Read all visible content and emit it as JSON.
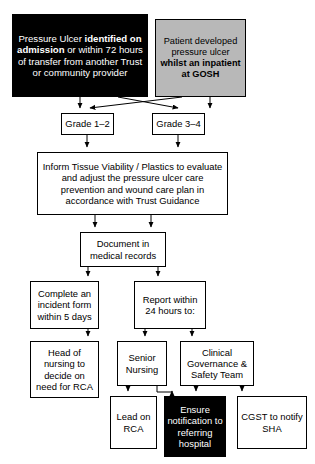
{
  "diagram": {
    "colors": {
      "black_box": "#000000",
      "black_box_text": "#ffffff",
      "gray_box": "#b8b8b8",
      "plain_box": "#ffffff",
      "border": "#000000",
      "background": "#ffffff"
    },
    "nodes": [
      {
        "id": "identified-on-admission",
        "name": "node-identified-on-admission",
        "style": "black",
        "x": 12,
        "y": 14,
        "w": 136,
        "h": 83,
        "font_size": 9.6,
        "segments": [
          {
            "text": "Pressure Ulcer ",
            "bold": false
          },
          {
            "text": "identified on admission",
            "bold": true
          },
          {
            "text": " or within 72 hours of transfer from another Trust or community provider",
            "bold": false
          }
        ],
        "text": "Pressure Ulcer identified on admission or within 72 hours of transfer from another Trust or community provider"
      },
      {
        "id": "developed-at-gosh",
        "name": "node-developed-at-gosh",
        "style": "gray",
        "x": 155,
        "y": 19,
        "w": 91,
        "h": 78,
        "font_size": 9.2,
        "segments": [
          {
            "text": "Patient developed pressure ulcer ",
            "bold": false
          },
          {
            "text": "whilst an inpatient at GOSH",
            "bold": true
          }
        ],
        "text": "Patient developed pressure ulcer whilst an inpatient at GOSH"
      },
      {
        "id": "grade-1-2",
        "name": "node-grade-1-2",
        "style": "plain",
        "x": 61,
        "y": 113,
        "w": 53,
        "h": 22,
        "font_size": 9.4,
        "text": "Grade 1–2"
      },
      {
        "id": "grade-3-4",
        "name": "node-grade-3-4",
        "style": "plain",
        "x": 152,
        "y": 113,
        "w": 53,
        "h": 22,
        "font_size": 9.4,
        "text": "Grade 3–4"
      },
      {
        "id": "inform-tissue-viability",
        "name": "node-inform-tissue-viability",
        "style": "plain",
        "x": 37,
        "y": 152,
        "w": 191,
        "h": 63,
        "font_size": 9.4,
        "text": "Inform Tissue Viability / Plastics to evaluate and adjust the pressure ulcer care prevention and wound care plan in accordance with Trust Guidance"
      },
      {
        "id": "document-in-medical-records",
        "name": "node-document-in-medical-records",
        "style": "plain",
        "x": 80,
        "y": 232,
        "w": 86,
        "h": 35,
        "font_size": 9.4,
        "text": "Document in medical records"
      },
      {
        "id": "complete-incident-form",
        "name": "node-complete-incident-form",
        "style": "plain",
        "x": 30,
        "y": 281,
        "w": 69,
        "h": 48,
        "font_size": 9.4,
        "text": "Complete an incident form within 5 days"
      },
      {
        "id": "report-within-24-hours",
        "name": "node-report-within-24-hours",
        "style": "plain",
        "x": 134,
        "y": 281,
        "w": 72,
        "h": 48,
        "font_size": 9.4,
        "text": "Report within 24 hours to:"
      },
      {
        "id": "head-of-nursing-rca",
        "name": "node-head-of-nursing-rca",
        "style": "plain",
        "x": 30,
        "y": 341,
        "w": 69,
        "h": 57,
        "font_size": 9.4,
        "text": "Head of nursing to decide on need for RCA"
      },
      {
        "id": "senior-nursing",
        "name": "node-senior-nursing",
        "style": "plain",
        "x": 117,
        "y": 341,
        "w": 50,
        "h": 45,
        "font_size": 9.4,
        "text": "Senior Nursing"
      },
      {
        "id": "clinical-governance-safety-team",
        "name": "node-clinical-governance-safety-team",
        "style": "plain",
        "x": 180,
        "y": 341,
        "w": 74,
        "h": 45,
        "font_size": 9.4,
        "text": "Clinical Governance & Safety Team"
      },
      {
        "id": "lead-on-rca",
        "name": "node-lead-on-rca",
        "style": "plain",
        "x": 110,
        "y": 396,
        "w": 47,
        "h": 53,
        "font_size": 9.4,
        "text": "Lead on RCA"
      },
      {
        "id": "ensure-notification",
        "name": "node-ensure-notification",
        "style": "black",
        "x": 164,
        "y": 396,
        "w": 62,
        "h": 61,
        "font_size": 9.4,
        "text": "Ensure notification to referring hospital"
      },
      {
        "id": "cgst-notify-sha",
        "name": "node-cgst-notify-sha",
        "style": "plain",
        "x": 237,
        "y": 396,
        "w": 70,
        "h": 53,
        "font_size": 9.4,
        "text": "CGST to notify SHA"
      }
    ],
    "edges": [
      {
        "id": "e1",
        "name": "edge-identified-to-grade-1-2",
        "from": "identified-on-admission",
        "to": "grade-1-2",
        "path": "M80,97 L80,108"
      },
      {
        "id": "e2",
        "name": "edge-identified-to-grade-3-4",
        "from": "identified-on-admission",
        "to": "grade-3-4",
        "path": "M118,97 L178,108"
      },
      {
        "id": "e3",
        "name": "edge-gosh-to-grade-1-2",
        "from": "developed-at-gosh",
        "to": "grade-1-2",
        "path": "M182,97 L90,108"
      },
      {
        "id": "e4",
        "name": "edge-gosh-to-grade-3-4",
        "from": "developed-at-gosh",
        "to": "grade-3-4",
        "path": "M210,97 L210,108"
      },
      {
        "id": "e5",
        "name": "edge-grade-1-2-to-inform",
        "from": "grade-1-2",
        "to": "inform-tissue-viability",
        "path": "M87,135 L87,147"
      },
      {
        "id": "e6",
        "name": "edge-grade-3-4-to-inform",
        "from": "grade-3-4",
        "to": "inform-tissue-viability",
        "path": "M178,135 L178,147"
      },
      {
        "id": "e7",
        "name": "edge-inform-to-document-left",
        "from": "inform-tissue-viability",
        "to": "document-in-medical-records",
        "path": "M95,215 L95,227"
      },
      {
        "id": "e8",
        "name": "edge-inform-to-document-right",
        "from": "inform-tissue-viability",
        "to": "document-in-medical-records",
        "path": "M151,215 L151,227"
      },
      {
        "id": "e9",
        "name": "edge-document-to-incident-form",
        "from": "document-in-medical-records",
        "to": "complete-incident-form",
        "path": "M88,267 L88,276"
      },
      {
        "id": "e10",
        "name": "edge-document-to-report",
        "from": "document-in-medical-records",
        "to": "report-within-24-hours",
        "path": "M158,267 L158,276"
      },
      {
        "id": "e11",
        "name": "edge-incident-to-head-of-nursing",
        "from": "complete-incident-form",
        "to": "head-of-nursing-rca",
        "path": "M88,329 L88,336"
      },
      {
        "id": "e12",
        "name": "edge-report-to-senior-nursing",
        "from": "report-within-24-hours",
        "to": "senior-nursing",
        "path": "M145,329 L145,336"
      },
      {
        "id": "e13",
        "name": "edge-report-to-clinical-governance",
        "from": "report-within-24-hours",
        "to": "clinical-governance-safety-team",
        "path": "M192,329 L192,336"
      },
      {
        "id": "e14",
        "name": "edge-senior-nursing-to-lead-rca",
        "from": "senior-nursing",
        "to": "lead-on-rca",
        "path": "M128,386 L128,391"
      },
      {
        "id": "e15",
        "name": "edge-senior-nursing-to-ensure",
        "from": "senior-nursing",
        "to": "ensure-notification",
        "path": "M157,386 L157,392 L172,392 L172,391"
      },
      {
        "id": "e16",
        "name": "edge-clinical-governance-to-ensure",
        "from": "clinical-governance-safety-team",
        "to": "ensure-notification",
        "path": "M196,386 L196,391"
      },
      {
        "id": "e17",
        "name": "edge-clinical-governance-to-cgst",
        "from": "clinical-governance-safety-team",
        "to": "cgst-notify-sha",
        "path": "M242,386 L242,391"
      }
    ]
  }
}
